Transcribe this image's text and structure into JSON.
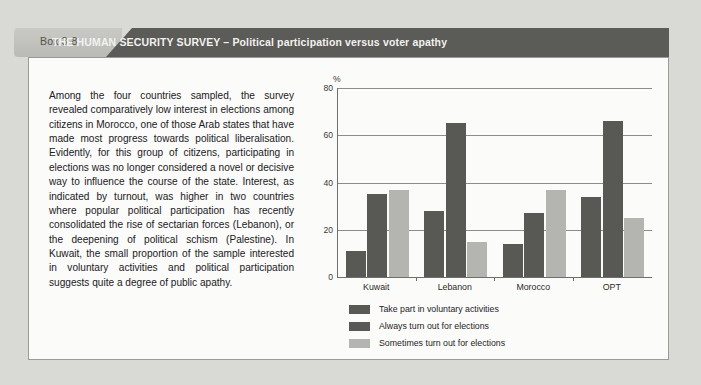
{
  "header": {
    "box_label": "Box 3-8",
    "title": "THE HUMAN SECURITY SURVEY – Political participation versus voter apathy",
    "tab_color": "#c2c2be",
    "band_color": "#5b5b57"
  },
  "body": {
    "paragraph": "Among the four countries sampled, the survey revealed comparatively low interest in elections among citizens in Morocco, one of those Arab states that have made most progress towards political liberalisation. Evidently, for this group of citizens, participating in elections was no longer considered a novel or decisive way to influence the course of the state. Interest, as indicated by turnout, was higher in two countries where popular political participation has recently consolidated the rise of sectarian forces (Lebanon), or the deepening of political schism (Palestine). In Kuwait, the small proportion of the sample interested in voluntary activities and political participation suggests quite a degree of public apathy."
  },
  "chart_data": {
    "type": "bar",
    "title": "",
    "xlabel": "",
    "ylabel": "%",
    "ylim": [
      0,
      80
    ],
    "yticks": [
      0,
      20,
      40,
      60,
      80
    ],
    "grid": true,
    "legend_position": "bottom-left",
    "categories": [
      "Kuwait",
      "Lebanon",
      "Morocco",
      "OPT"
    ],
    "series": [
      {
        "name": "Take part in voluntary activities",
        "color": "#585854",
        "values": [
          11,
          28,
          14,
          34
        ]
      },
      {
        "name": "Always turn out for elections",
        "color": "#585854",
        "values": [
          35,
          65,
          27,
          66
        ]
      },
      {
        "name": "Sometimes turn out for elections",
        "color": "#b4b4b0",
        "values": [
          37,
          15,
          37,
          25
        ]
      }
    ]
  }
}
